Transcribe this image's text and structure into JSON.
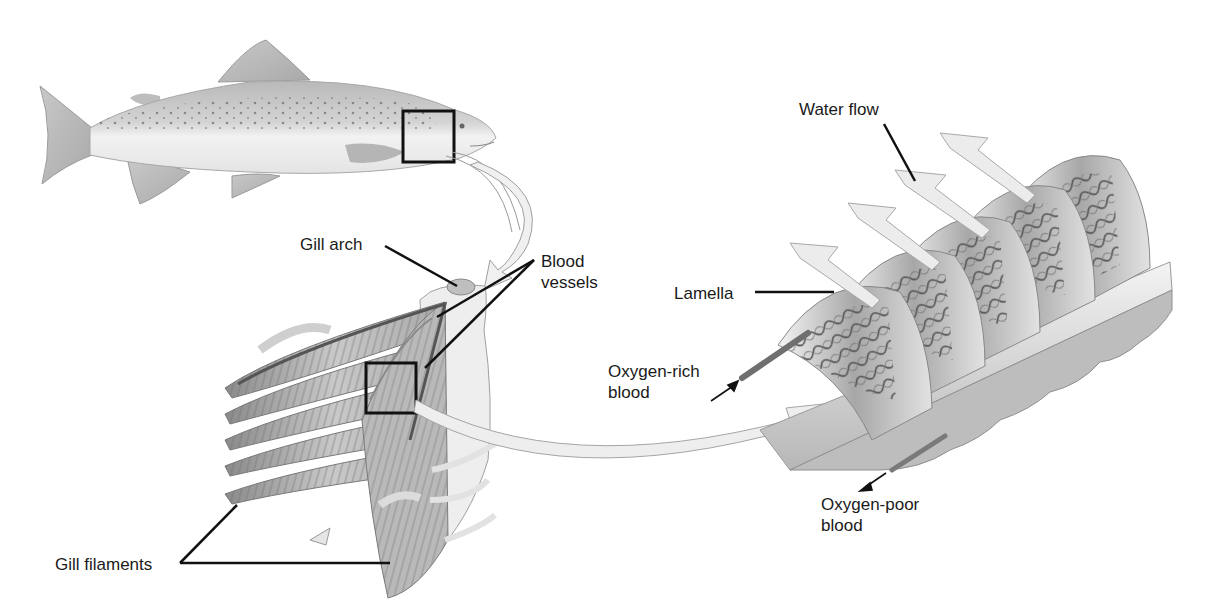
{
  "diagram": {
    "labels": {
      "gill_arch": "Gill arch",
      "blood_vessels": "Blood\nvessels",
      "gill_filaments": "Gill filaments",
      "water_flow": "Water flow",
      "lamella": "Lamella",
      "oxygen_rich_blood": "Oxygen-rich\nblood",
      "oxygen_poor_blood": "Oxygen-poor\nblood"
    },
    "colors": {
      "background": "#ffffff",
      "text": "#1a1a1a",
      "leader_line": "#111111",
      "fish_body": "#d9d9d9",
      "tissue_gray": "#9a9a9a",
      "arrow_fill": "#ececec"
    },
    "panels": [
      {
        "name": "whole-fish",
        "description": "Trout with boxed gill region"
      },
      {
        "name": "gill-arch-detail",
        "description": "Gill arch with filaments and blood vessels"
      },
      {
        "name": "lamellae-detail",
        "description": "Enlarged lamellae with water flow arrows"
      }
    ]
  }
}
